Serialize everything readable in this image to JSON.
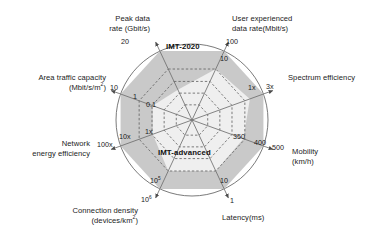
{
  "chart_data": {
    "type": "radar",
    "title": "",
    "grid": true,
    "legend_position": "inside-plot",
    "center": {
      "x": 192,
      "y": 120
    },
    "outer_radius": 76,
    "axes": [
      {
        "key": "peak-data-rate",
        "label_line1": "Peak data",
        "label_line2": "rate (Gbit/s)",
        "angle_deg": -115,
        "ticks": [
          {
            "text": "20",
            "r_frac": 1.0
          }
        ],
        "imt2020": 1.0,
        "imt_advanced": 0.44
      },
      {
        "key": "user-experienced-data-rate",
        "label_line1": "User experienced",
        "label_line2": "data rate(Mbit/s)",
        "angle_deg": -65,
        "ticks": [
          {
            "text": "100",
            "r_frac": 1.0
          },
          {
            "text": "10",
            "r_frac": 0.74
          }
        ],
        "imt2020": 1.0,
        "imt_advanced": 0.74
      },
      {
        "key": "spectrum-efficiency",
        "label_line1": "Spectrum efficiency",
        "label_line2": "",
        "angle_deg": -20,
        "ticks": [
          {
            "text": "3x",
            "r_frac": 1.0
          },
          {
            "text": "1x",
            "r_frac": 0.81
          }
        ],
        "imt2020": 1.0,
        "imt_advanced": 0.81
      },
      {
        "key": "mobility",
        "label_line1": "Mobility",
        "label_line2": "(km/h)",
        "angle_deg": 20,
        "ticks": [
          {
            "text": "500",
            "r_frac": 1.0
          },
          {
            "text": "400",
            "r_frac": 0.86
          },
          {
            "text": "350",
            "r_frac": 0.72
          }
        ],
        "imt2020": 1.0,
        "imt_advanced": 0.72
      },
      {
        "key": "latency",
        "label_line1": "Latency(ms)",
        "label_line2": "",
        "angle_deg": 65,
        "ticks": [
          {
            "text": "1",
            "r_frac": 1.0
          },
          {
            "text": "10",
            "r_frac": 0.74
          }
        ],
        "imt2020": 1.0,
        "imt_advanced": 0.74
      },
      {
        "key": "connection-density",
        "label_line1": "Connection density",
        "label_line2": "(devices/km²)",
        "angle_deg": 115,
        "ticks": [
          {
            "text": "10⁶",
            "r_frac": 1.0
          },
          {
            "text": "10⁵",
            "r_frac": 0.74
          }
        ],
        "imt2020": 1.0,
        "imt_advanced": 0.74
      },
      {
        "key": "network-energy-efficiency",
        "label_line1": "Network",
        "label_line2": "energy efficiency",
        "angle_deg": 160,
        "ticks": [
          {
            "text": "100x",
            "r_frac": 1.0
          },
          {
            "text": "10x",
            "r_frac": 0.81
          },
          {
            "text": "1x",
            "r_frac": 0.55
          }
        ],
        "imt2020": 1.0,
        "imt_advanced": 0.55
      },
      {
        "key": "area-traffic-capacity",
        "label_line1": "Area traffic capacity",
        "label_line2": "(Mbit/s/m²)",
        "angle_deg": -160,
        "ticks": [
          {
            "text": "10",
            "r_frac": 1.0
          },
          {
            "text": "1",
            "r_frac": 0.75
          },
          {
            "text": "0.1",
            "r_frac": 0.55
          }
        ],
        "imt2020": 1.0,
        "imt_advanced": 0.55
      }
    ],
    "series": [
      {
        "name": "IMT-2020",
        "fill": "#c9c9c9",
        "label_color": "#111111"
      },
      {
        "name": "IMT-advanced",
        "fill": "#efefef",
        "label_color": "#111111"
      }
    ],
    "gridlines_r_frac": [
      0.22,
      0.39,
      0.56,
      0.74
    ],
    "colors": {
      "background": "#ffffff",
      "outer_circle": "#6b6b6b",
      "axis_line": "#6f6f6f",
      "gridline": "#5d5d5d",
      "imt2020_fill": "#c9c9c9",
      "imt_advanced_fill": "#efefef",
      "text": "#1b1b1b"
    }
  },
  "labels": {
    "series_imt2020": "IMT-2020",
    "series_imt_advanced": "IMT-advanced",
    "peak_data_rate_l1": "Peak data",
    "peak_data_rate_l2": "rate (Gbit/s)",
    "user_exp_l1": "User experienced",
    "user_exp_l2": "data rate(Mbit/s)",
    "spectrum_efficiency": "Spectrum efficiency",
    "mobility_l1": "Mobility",
    "mobility_l2": "(km/h)",
    "latency": "Latency(ms)",
    "connection_density_l1": "Connection density",
    "connection_density_l2": "(devices/km",
    "connection_density_sup": "2",
    "connection_density_l2end": ")",
    "network_energy_l1": "Network",
    "network_energy_l2": "energy efficiency",
    "area_traffic_l1": "Area traffic capacity",
    "area_traffic_l2": "(Mbit/s/m",
    "area_traffic_sup": "2",
    "area_traffic_l2end": ")"
  },
  "ticks": {
    "peak_20": "20",
    "user_100": "100",
    "user_10": "10",
    "spec_3x": "3x",
    "spec_1x": "1x",
    "mob_500": "500",
    "mob_400": "400",
    "mob_350": "350",
    "lat_1": "1",
    "lat_10": "10",
    "conn_outer_base": "10",
    "conn_outer_exp": "6",
    "conn_inner_base": "10",
    "conn_inner_exp": "5",
    "net_100x": "100x",
    "net_10x": "10x",
    "net_1x": "1x",
    "area_10": "10",
    "area_1": "1",
    "area_01": "0.1"
  }
}
